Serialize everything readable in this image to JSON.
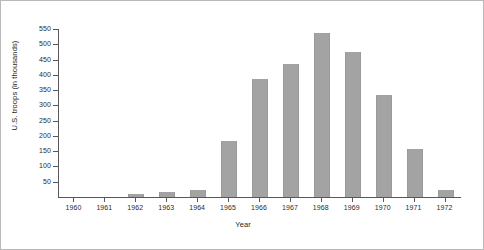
{
  "chart_data": {
    "type": "bar",
    "title": "",
    "xlabel": "Year",
    "ylabel": "U.S. troops (in thousands)",
    "categories": [
      "1960",
      "1961",
      "1962",
      "1963",
      "1964",
      "1965",
      "1966",
      "1967",
      "1968",
      "1969",
      "1970",
      "1971",
      "1972"
    ],
    "values": [
      0,
      0,
      11,
      16,
      23,
      184,
      385,
      435,
      536,
      475,
      334,
      157,
      24
    ],
    "ylim": [
      0,
      550
    ],
    "yticks": [
      50,
      100,
      150,
      200,
      250,
      300,
      350,
      400,
      450,
      500,
      550
    ],
    "ytick_labels": [
      "50",
      "100",
      "150",
      "200",
      "250",
      "300",
      "350",
      "400",
      "450",
      "500",
      "550"
    ],
    "grid": false,
    "legend": "none",
    "bar_color": "#a3a3a3",
    "axis_color": "#58585a",
    "background_color": "#ffffff",
    "border_color": "#b9b9b9"
  }
}
